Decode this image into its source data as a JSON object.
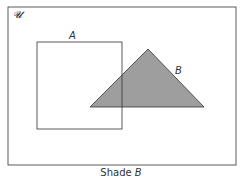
{
  "diagram": {
    "type": "venn",
    "universal_label": "𝓤",
    "sets": [
      {
        "name": "A",
        "shape": "square",
        "shaded": false
      },
      {
        "name": "B",
        "shape": "triangle",
        "shaded": true
      }
    ],
    "shade_color": "#9e9e9e",
    "stroke_color": "#333333"
  },
  "caption": {
    "prefix": "Shade ",
    "set": "B"
  }
}
